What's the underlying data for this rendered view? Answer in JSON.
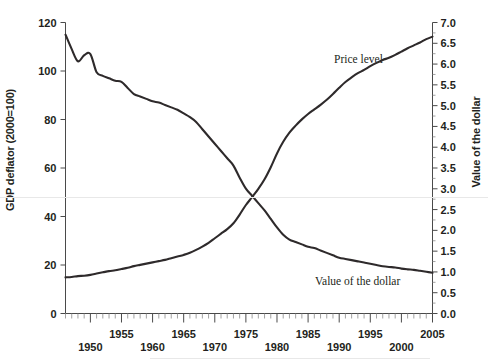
{
  "chart_data": {
    "type": "line",
    "title": "",
    "subtitle": "",
    "xlabel": "",
    "ylabel": "GDP deflator (2000=100)",
    "y2label": "Value of the dollar",
    "xlim": [
      1946,
      2005
    ],
    "ylim": [
      0,
      120
    ],
    "y2lim": [
      0.0,
      7.0
    ],
    "grid": false,
    "legend_position": "inline-annotations",
    "x_tick_labels": [
      "1950",
      "1955",
      "1960",
      "1965",
      "1970",
      "1975",
      "1980",
      "1985",
      "1990",
      "1995",
      "2000",
      "2005"
    ],
    "x_tick_values": [
      1950,
      1955,
      1960,
      1965,
      1970,
      1975,
      1980,
      1985,
      1990,
      1995,
      2000,
      2005
    ],
    "x_minor_tick_interval": 1,
    "y_tick_labels": [
      "0",
      "20",
      "40",
      "60",
      "80",
      "100",
      "120"
    ],
    "y_tick_values": [
      0,
      20,
      40,
      60,
      80,
      100,
      120
    ],
    "y2_tick_labels": [
      "0.0",
      "0.5",
      "1.0",
      "1.5",
      "2.0",
      "2.5",
      "3.0",
      "3.5",
      "4.0",
      "4.5",
      "5.0",
      "5.5",
      "6.0",
      "6.5",
      "7.0"
    ],
    "y2_tick_values": [
      0.0,
      0.5,
      1.0,
      1.5,
      2.0,
      2.5,
      3.0,
      3.5,
      4.0,
      4.5,
      5.0,
      5.5,
      6.0,
      6.5,
      7.0
    ],
    "annotations": [
      {
        "text": "Price level",
        "x": 1992,
        "y": 5.6,
        "axis": "right"
      },
      {
        "text": "Value of the dollar",
        "x": 1989,
        "y": 1.25,
        "axis": "right"
      }
    ],
    "series": [
      {
        "name": "Value of the dollar",
        "axis": "left",
        "units": "GDP deflator (2000=100) scale",
        "x": [
          1946,
          1947,
          1948,
          1949,
          1950,
          1951,
          1952,
          1953,
          1954,
          1955,
          1956,
          1957,
          1958,
          1959,
          1960,
          1961,
          1962,
          1963,
          1964,
          1965,
          1966,
          1967,
          1968,
          1969,
          1970,
          1971,
          1972,
          1973,
          1974,
          1975,
          1976,
          1977,
          1978,
          1979,
          1980,
          1981,
          1982,
          1983,
          1984,
          1985,
          1986,
          1987,
          1988,
          1989,
          1990,
          1991,
          1992,
          1993,
          1994,
          1995,
          1996,
          1997,
          1998,
          1999,
          2000,
          2001,
          2002,
          2003,
          2004,
          2005
        ],
        "y": [
          115.0,
          109.0,
          104.0,
          106.5,
          107.0,
          99.5,
          98.0,
          97.0,
          96.0,
          95.5,
          93.0,
          90.5,
          89.5,
          88.5,
          87.5,
          87.0,
          86.0,
          85.0,
          84.0,
          82.5,
          81.0,
          79.0,
          76.0,
          73.0,
          70.0,
          67.0,
          64.0,
          61.0,
          56.0,
          51.5,
          48.5,
          45.5,
          42.5,
          39.0,
          35.5,
          32.5,
          30.5,
          29.5,
          28.5,
          27.5,
          27.0,
          26.0,
          25.0,
          24.0,
          23.0,
          22.5,
          22.0,
          21.5,
          21.0,
          20.5,
          20.0,
          19.5,
          19.2,
          19.0,
          18.5,
          18.2,
          18.0,
          17.6,
          17.2,
          16.8
        ]
      },
      {
        "name": "Price level",
        "axis": "right",
        "units": "Value of the dollar scale (0.0 - 7.0)",
        "x": [
          1946,
          1947,
          1948,
          1949,
          1950,
          1951,
          1952,
          1953,
          1954,
          1955,
          1956,
          1957,
          1958,
          1959,
          1960,
          1961,
          1962,
          1963,
          1964,
          1965,
          1966,
          1967,
          1968,
          1969,
          1970,
          1971,
          1972,
          1973,
          1974,
          1975,
          1976,
          1977,
          1978,
          1979,
          1980,
          1981,
          1982,
          1983,
          1984,
          1985,
          1986,
          1987,
          1988,
          1989,
          1990,
          1991,
          1992,
          1993,
          1994,
          1995,
          1996,
          1997,
          1998,
          1999,
          2000,
          2001,
          2002,
          2003,
          2004,
          2005
        ],
        "y": [
          0.87,
          0.88,
          0.9,
          0.91,
          0.93,
          0.96,
          0.99,
          1.02,
          1.04,
          1.07,
          1.1,
          1.14,
          1.17,
          1.2,
          1.23,
          1.26,
          1.29,
          1.33,
          1.37,
          1.41,
          1.46,
          1.53,
          1.61,
          1.7,
          1.81,
          1.92,
          2.03,
          2.17,
          2.38,
          2.61,
          2.8,
          3.0,
          3.23,
          3.52,
          3.85,
          4.13,
          4.35,
          4.52,
          4.67,
          4.8,
          4.91,
          5.02,
          5.14,
          5.28,
          5.43,
          5.57,
          5.68,
          5.78,
          5.86,
          5.95,
          6.03,
          6.1,
          6.15,
          6.22,
          6.3,
          6.38,
          6.45,
          6.52,
          6.6,
          6.66
        ]
      }
    ]
  },
  "labels": {
    "left_axis_title": "GDP deflator (2000=100)",
    "right_axis_title": "Value of the dollar",
    "price_level": "Price level",
    "value_of_dollar": "Value of the dollar"
  },
  "colors": {
    "curve": "#2e2a2b",
    "axis": "#4a4a4a",
    "text": "#231f20",
    "background": "#ffffff"
  }
}
